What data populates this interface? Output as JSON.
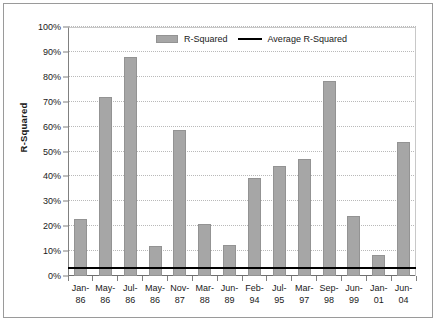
{
  "chart_data": {
    "type": "bar",
    "title": "",
    "xlabel": "",
    "ylabel": "R-Squared",
    "ylim": [
      0,
      100
    ],
    "yticks": [
      "0%",
      "10%",
      "20%",
      "30%",
      "40%",
      "50%",
      "60%",
      "70%",
      "80%",
      "90%",
      "100%"
    ],
    "ytick_values": [
      0,
      10,
      20,
      30,
      40,
      50,
      60,
      70,
      80,
      90,
      100
    ],
    "grid": true,
    "legend_position": "top-center",
    "categories": [
      "Jan-86",
      "May-86",
      "Jul-86",
      "May-86",
      "Nov-87",
      "Mar-88",
      "Jun-89",
      "Feb-94",
      "Jul-95",
      "Mar-97",
      "Sep-98",
      "Jun-99",
      "Jan-01",
      "Jun-04"
    ],
    "category_lines": [
      [
        "Jan-",
        "86"
      ],
      [
        "May-",
        "86"
      ],
      [
        "Jul-",
        "86"
      ],
      [
        "May-",
        "86"
      ],
      [
        "Nov-",
        "87"
      ],
      [
        "Mar-",
        "88"
      ],
      [
        "Jun-",
        "89"
      ],
      [
        "Feb-",
        "94"
      ],
      [
        "Jul-",
        "95"
      ],
      [
        "Mar-",
        "97"
      ],
      [
        "Sep-",
        "98"
      ],
      [
        "Jun-",
        "99"
      ],
      [
        "Jan-",
        "01"
      ],
      [
        "Jun-",
        "04"
      ]
    ],
    "series": [
      {
        "name": "R-Squared",
        "type": "bar",
        "color": "#a6a6a6",
        "values": [
          23,
          72,
          88,
          12,
          58.5,
          21,
          12.5,
          39.5,
          44,
          47,
          78.5,
          24,
          8.5,
          54
        ]
      },
      {
        "name": "Average R-Squared",
        "type": "line",
        "color": "#000000",
        "constant_value": 3
      }
    ]
  },
  "legend": {
    "items": [
      {
        "label": "R-Squared",
        "marker": "bar-swatch",
        "color": "#a6a6a6"
      },
      {
        "label": "Average R-Squared",
        "marker": "line-swatch",
        "color": "#000000"
      }
    ]
  },
  "axis": {
    "y_title": "R-Squared"
  }
}
